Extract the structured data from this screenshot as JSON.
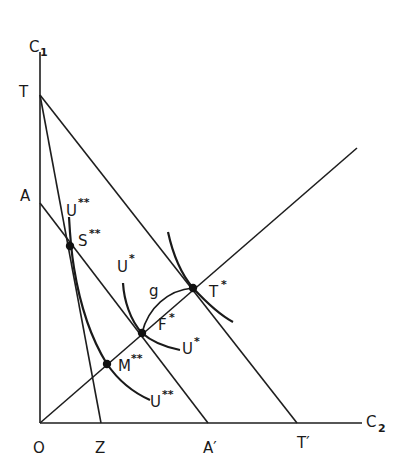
{
  "diagram": {
    "type": "economics indifference-curve diagram",
    "axes": {
      "y_label": "C",
      "y_label_sub": "1",
      "x_label": "C",
      "x_label_sub": "2",
      "origin_label": "O"
    },
    "axis_points": {
      "T": "T",
      "A": "A",
      "Z": "Z",
      "A_prime": "A′",
      "T_prime": "T′"
    },
    "lines": [
      {
        "name": "TT'",
        "from": "T",
        "to": "T′"
      },
      {
        "name": "AA'",
        "from": "A",
        "to": "A′"
      },
      {
        "name": "TZ",
        "from": "T",
        "to": "Z"
      },
      {
        "name": "ray-from-origin",
        "from": "O",
        "to": "upper-right"
      }
    ],
    "points": {
      "S": {
        "label": "S",
        "sup": "**"
      },
      "F": {
        "label": "F",
        "sup": "*"
      },
      "T_star": {
        "label": "T",
        "sup": "*"
      },
      "M": {
        "label": "M",
        "sup": "**"
      }
    },
    "curves": {
      "U_double_top": {
        "label": "U",
        "sup": "**"
      },
      "U_double_bottom": {
        "label": "U",
        "sup": "**"
      },
      "U_star_top": {
        "label": "U",
        "sup": "*"
      },
      "U_star_bottom": {
        "label": "U",
        "sup": "*"
      },
      "g": {
        "label": "g"
      }
    }
  }
}
